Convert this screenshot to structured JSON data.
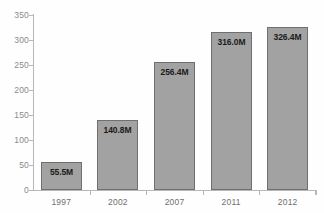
{
  "chart_data": {
    "type": "bar",
    "title": "",
    "subtitle": "",
    "xlabel": "",
    "ylabel": "",
    "categories": [
      "1997",
      "2002",
      "2007",
      "2011",
      "2012"
    ],
    "values": [
      55.5,
      140.8,
      256.4,
      316.0,
      326.4
    ],
    "data_labels": [
      "55.5M",
      "140.8M",
      "256.4M",
      "316.0M",
      "326.4M"
    ],
    "ylim": [
      0,
      350
    ],
    "ytick_values": [
      0,
      50,
      100,
      150,
      200,
      250,
      300,
      350
    ],
    "ytick_labels": [
      "0",
      "50",
      "100",
      "150",
      "200",
      "250",
      "300",
      "350"
    ],
    "grid": false,
    "legend": null,
    "series": [
      {
        "name": "",
        "values": [
          55.5,
          140.8,
          256.4,
          316.0,
          326.4
        ]
      }
    ],
    "colors": {
      "bar_fill": "#a2a2a2",
      "bar_border": "#6f6f6f",
      "axis": "#b7b7b7",
      "tick_label": "#8a8a8a",
      "category_label": "#6f6f6f",
      "data_label": "#1a1a1a",
      "background": "#fefefe"
    }
  }
}
